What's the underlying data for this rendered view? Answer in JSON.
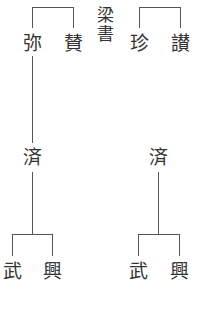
{
  "diagram": {
    "type": "genealogy",
    "source_label": {
      "chars": [
        "梁",
        "書"
      ],
      "text": "梁書"
    },
    "top_generation": {
      "left_pair": [
        {
          "id": "mi",
          "name": "弥"
        },
        {
          "id": "zan_l",
          "name": "賛"
        }
      ],
      "right_pair": [
        {
          "id": "zhen",
          "name": "珍"
        },
        {
          "id": "zan_r",
          "name": "讃"
        }
      ]
    },
    "middle_generation": {
      "left": {
        "id": "ji_l",
        "name": "済",
        "parent": "弥"
      },
      "right": {
        "id": "ji_r",
        "name": "済"
      }
    },
    "bottom_generation": {
      "left_children": [
        {
          "id": "wu_l",
          "name": "武",
          "parent": "済"
        },
        {
          "id": "xing_l",
          "name": "興",
          "parent": "済"
        }
      ],
      "right_children": [
        {
          "id": "wu_r",
          "name": "武",
          "parent": "済"
        },
        {
          "id": "xing_r",
          "name": "興",
          "parent": "済"
        }
      ]
    },
    "colors": {
      "line": "#555555",
      "text": "#333333",
      "background": "#ffffff"
    }
  }
}
